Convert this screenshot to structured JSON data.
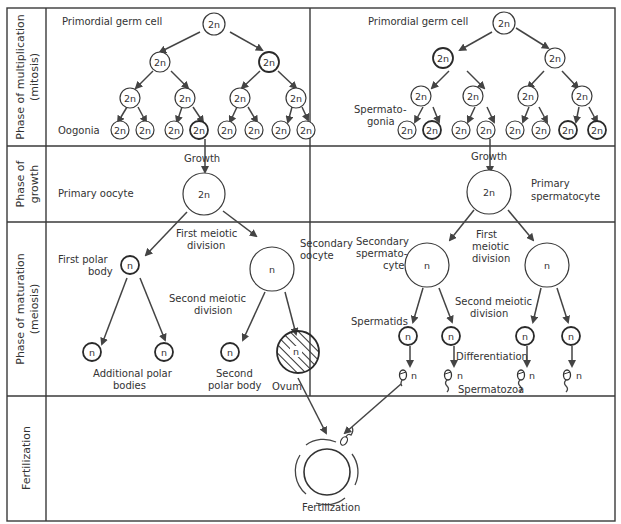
{
  "phases": {
    "multiplication": "Phase of multiplication",
    "multiplication_sub": "(mitosis)",
    "growth": "Phase of",
    "growth_sub": "growth",
    "maturation": "Phase of  maturation",
    "maturation_sub": "(meiosis)",
    "fertilization": "Fertilization"
  },
  "oogenesis": {
    "primordial_label": "Primordial germ cell",
    "oogonia_label": "Oogonia",
    "growth_label": "Growth",
    "primary_oocyte_label": "Primary oocyte",
    "first_meiotic_1": "First meiotic",
    "first_meiotic_2": "division",
    "first_polar_1": "First polar",
    "first_polar_2": "body",
    "secondary_oocyte_1": "Secondary",
    "secondary_oocyte_2": "oocyte",
    "second_meiotic_1": "Second meiotic",
    "second_meiotic_2": "division",
    "additional_polar_1": "Additional polar",
    "additional_polar_2": "bodies",
    "second_polar_1": "Second",
    "second_polar_2": "polar body",
    "ovum_label": "Ovum"
  },
  "spermatogenesis": {
    "primordial_label": "Primordial germ cell",
    "spermatogonia_1": "Spermato-",
    "spermatogonia_2": "gonia",
    "growth_label": "Growth",
    "primary_spermatocyte_1": "Primary",
    "primary_spermatocyte_2": "spermatocyte",
    "secondary_spermatocyte_1": "Secondary",
    "secondary_spermatocyte_2": "spermato-",
    "secondary_spermatocyte_3": "cyte",
    "first_meiotic_1": "First",
    "first_meiotic_2": "meiotic",
    "first_meiotic_3": "division",
    "second_meiotic_1": "Second meiotic",
    "second_meiotic_2": "division",
    "spermatids_label": "Spermatids",
    "differentiation_label": "Differentiation",
    "spermatozoa_label": "Spermatozoa"
  },
  "fertilization": {
    "label": "Fertilization"
  },
  "ploidy": {
    "diploid": "2n",
    "haploid": "n"
  }
}
